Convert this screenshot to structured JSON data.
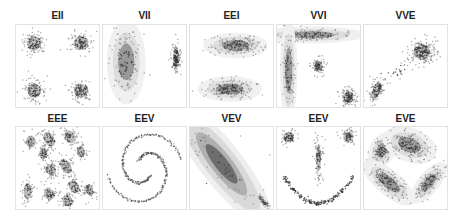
{
  "chart_data": {
    "type": "scatter",
    "title": "",
    "grid": false,
    "legend": null,
    "panels": [
      {
        "title": "EII",
        "row": 0,
        "col": 0,
        "clusters": [
          {
            "x": 0.22,
            "y": 0.22,
            "sx": 0.07,
            "sy": 0.07,
            "r": 0,
            "n": 110
          },
          {
            "x": 0.78,
            "y": 0.22,
            "sx": 0.07,
            "sy": 0.07,
            "r": 0,
            "n": 110
          },
          {
            "x": 0.22,
            "y": 0.8,
            "sx": 0.07,
            "sy": 0.07,
            "r": 0,
            "n": 110
          },
          {
            "x": 0.78,
            "y": 0.8,
            "sx": 0.07,
            "sy": 0.07,
            "r": 0,
            "n": 110
          }
        ]
      },
      {
        "title": "VII",
        "row": 0,
        "col": 1,
        "clusters": [
          {
            "x": 0.28,
            "y": 0.45,
            "sx": 0.09,
            "sy": 0.2,
            "r": 0,
            "n": 120,
            "halo": true
          },
          {
            "x": 0.88,
            "y": 0.4,
            "sx": 0.03,
            "sy": 0.1,
            "r": 0,
            "n": 140
          }
        ]
      },
      {
        "title": "EEI",
        "row": 0,
        "col": 2,
        "clusters": [
          {
            "x": 0.55,
            "y": 0.25,
            "sx": 0.15,
            "sy": 0.06,
            "r": 0,
            "n": 150,
            "halo": true
          },
          {
            "x": 0.48,
            "y": 0.78,
            "sx": 0.15,
            "sy": 0.06,
            "r": 0,
            "n": 150,
            "halo": true
          }
        ]
      },
      {
        "title": "VVI",
        "row": 0,
        "col": 3,
        "clusters": [
          {
            "x": 0.42,
            "y": 0.12,
            "sx": 0.25,
            "sy": 0.04,
            "r": 0,
            "n": 110,
            "halo": true
          },
          {
            "x": 0.14,
            "y": 0.55,
            "sx": 0.04,
            "sy": 0.25,
            "r": 0,
            "n": 90,
            "halo": true
          },
          {
            "x": 0.5,
            "y": 0.5,
            "sx": 0.04,
            "sy": 0.05,
            "r": 0,
            "n": 90
          },
          {
            "x": 0.86,
            "y": 0.88,
            "sx": 0.05,
            "sy": 0.06,
            "r": 0,
            "n": 130
          }
        ]
      },
      {
        "title": "VVE",
        "row": 0,
        "col": 4,
        "clusters": [
          {
            "x": 0.7,
            "y": 0.33,
            "sx": 0.08,
            "sy": 0.08,
            "r": -30,
            "n": 200
          },
          {
            "x": 0.15,
            "y": 0.8,
            "sx": 0.04,
            "sy": 0.09,
            "r": 20,
            "n": 110
          },
          {
            "x": 0.42,
            "y": 0.56,
            "sx": 0.1,
            "sy": 0.05,
            "r": -40,
            "n": 25
          }
        ]
      },
      {
        "title": "EEE",
        "row": 1,
        "col": 0,
        "clusters": [
          {
            "x": 0.18,
            "y": 0.18,
            "sx": 0.05,
            "sy": 0.06,
            "r": 0,
            "n": 35
          },
          {
            "x": 0.4,
            "y": 0.15,
            "sx": 0.05,
            "sy": 0.08,
            "r": -30,
            "n": 55
          },
          {
            "x": 0.65,
            "y": 0.12,
            "sx": 0.05,
            "sy": 0.07,
            "r": -30,
            "n": 55
          },
          {
            "x": 0.33,
            "y": 0.32,
            "sx": 0.04,
            "sy": 0.06,
            "r": 0,
            "n": 45
          },
          {
            "x": 0.78,
            "y": 0.3,
            "sx": 0.04,
            "sy": 0.06,
            "r": 0,
            "n": 40
          },
          {
            "x": 0.42,
            "y": 0.52,
            "sx": 0.05,
            "sy": 0.06,
            "r": -30,
            "n": 55
          },
          {
            "x": 0.6,
            "y": 0.48,
            "sx": 0.05,
            "sy": 0.08,
            "r": -30,
            "n": 60
          },
          {
            "x": 0.14,
            "y": 0.78,
            "sx": 0.04,
            "sy": 0.08,
            "r": 0,
            "n": 55
          },
          {
            "x": 0.4,
            "y": 0.82,
            "sx": 0.05,
            "sy": 0.06,
            "r": -30,
            "n": 50
          },
          {
            "x": 0.62,
            "y": 0.9,
            "sx": 0.05,
            "sy": 0.06,
            "r": -30,
            "n": 50
          },
          {
            "x": 0.7,
            "y": 0.73,
            "sx": 0.05,
            "sy": 0.07,
            "r": -30,
            "n": 50
          },
          {
            "x": 0.88,
            "y": 0.77,
            "sx": 0.04,
            "sy": 0.06,
            "r": -30,
            "n": 45
          }
        ]
      },
      {
        "title": "EEV",
        "row": 1,
        "col": 1,
        "spiral": true
      },
      {
        "title": "VEV",
        "row": 1,
        "col": 2,
        "clusters": [
          {
            "x": 0.38,
            "y": 0.45,
            "sx": 0.08,
            "sy": 0.3,
            "r": -38,
            "n": 40,
            "halo": true,
            "big": true
          },
          {
            "x": 0.88,
            "y": 0.9,
            "sx": 0.02,
            "sy": 0.07,
            "r": -45,
            "n": 40
          },
          {
            "x": 0.4,
            "y": 0.5,
            "sx": 0.35,
            "sy": 0.35,
            "r": 0,
            "n": 12
          }
        ]
      },
      {
        "title": "EEV",
        "row": 1,
        "col": 3,
        "smile": true,
        "clusters": [
          {
            "x": 0.14,
            "y": 0.12,
            "sx": 0.05,
            "sy": 0.05,
            "r": 0,
            "n": 70
          },
          {
            "x": 0.86,
            "y": 0.12,
            "sx": 0.05,
            "sy": 0.05,
            "r": 0,
            "n": 70
          },
          {
            "x": 0.5,
            "y": 0.38,
            "sx": 0.025,
            "sy": 0.13,
            "r": 0,
            "n": 90
          }
        ]
      },
      {
        "title": "EVE",
        "row": 1,
        "col": 4,
        "clusters": [
          {
            "x": 0.22,
            "y": 0.28,
            "sx": 0.06,
            "sy": 0.09,
            "r": 30,
            "n": 90,
            "halo": true
          },
          {
            "x": 0.55,
            "y": 0.22,
            "sx": 0.13,
            "sy": 0.08,
            "r": 20,
            "n": 150,
            "halo": true
          },
          {
            "x": 0.3,
            "y": 0.68,
            "sx": 0.15,
            "sy": 0.06,
            "r": 40,
            "n": 130,
            "halo": true
          },
          {
            "x": 0.78,
            "y": 0.68,
            "sx": 0.05,
            "sy": 0.12,
            "r": 40,
            "n": 100,
            "halo": true
          }
        ]
      }
    ]
  },
  "layout": {
    "left": 15,
    "col_step": 87,
    "row_tops": [
      24,
      126
    ],
    "title_tops": [
      10,
      113
    ]
  }
}
